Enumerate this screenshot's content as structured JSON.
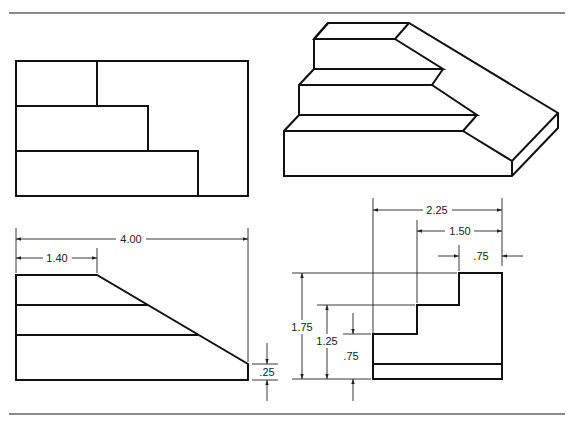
{
  "views": {
    "top_view": "top view",
    "isometric_view": "isometric pictorial",
    "front_view": "front view",
    "right_view": "right side view"
  },
  "dimensions": {
    "front_overall_width": "4.00",
    "front_top_width": "1.40",
    "front_base_height": ".25",
    "right_overall_depth": "2.25",
    "right_middle_depth": "1.50",
    "right_top_depth": ".75",
    "right_overall_height": "1.75",
    "right_middle_height": "1.25",
    "right_lower_height": ".75"
  },
  "colors": {
    "line": "#111111",
    "rule": "#8a8a8a"
  }
}
